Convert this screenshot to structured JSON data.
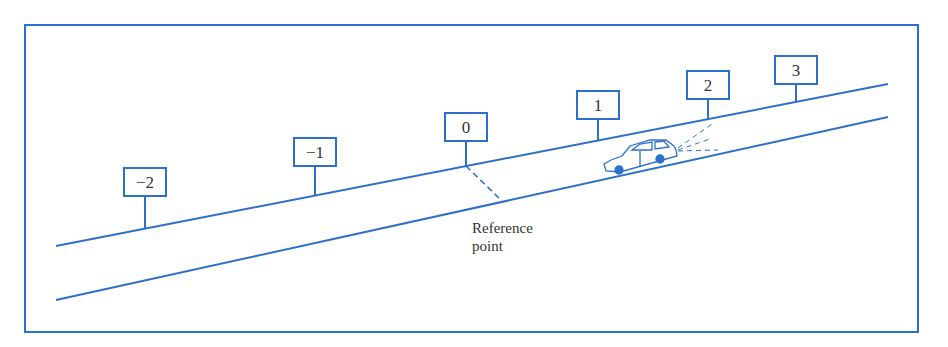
{
  "colors": {
    "line": "#2f6fcc",
    "text": "#333333",
    "background": "#ffffff"
  },
  "markers": [
    {
      "label": "−2",
      "x": 145,
      "box_top": 168,
      "ground_y": 229
    },
    {
      "label": "−1",
      "x": 315,
      "box_top": 138,
      "ground_y": 196
    },
    {
      "label": "0",
      "x": 466,
      "box_top": 113,
      "ground_y": 166
    },
    {
      "label": "1",
      "x": 598,
      "box_top": 91,
      "ground_y": 140
    },
    {
      "label": "2",
      "x": 708,
      "box_top": 71,
      "ground_y": 119
    },
    {
      "label": "3",
      "x": 796,
      "box_top": 56,
      "ground_y": 101
    }
  ],
  "annotation": {
    "line1": "Reference",
    "line2": "point"
  }
}
